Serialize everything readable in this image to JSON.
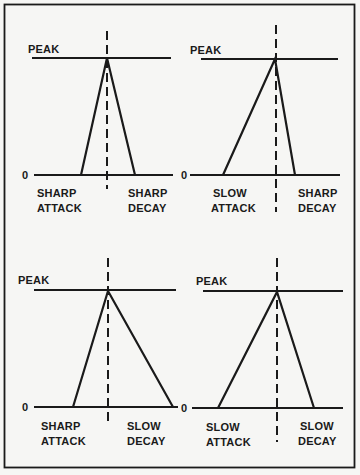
{
  "diagram": {
    "title": "",
    "panels": [
      {
        "id": "sharp-attack-sharp-decay",
        "peak_label": "PEAK",
        "zero_label": "0",
        "attack_label": [
          "SHARP",
          "ATTACK"
        ],
        "decay_label": [
          "SHARP",
          "DECAY"
        ]
      },
      {
        "id": "slow-attack-sharp-decay",
        "peak_label": "PEAK",
        "zero_label": "0",
        "attack_label": [
          "SLOW",
          "ATTACK"
        ],
        "decay_label": [
          "SHARP",
          "DECAY"
        ]
      },
      {
        "id": "sharp-attack-slow-decay",
        "peak_label": "PEAK",
        "zero_label": "0",
        "attack_label": [
          "SHARP",
          "ATTACK"
        ],
        "decay_label": [
          "SLOW",
          "DECAY"
        ]
      },
      {
        "id": "slow-attack-slow-decay",
        "peak_label": "PEAK",
        "zero_label": "0",
        "attack_label": [
          "SLOW",
          "ATTACK"
        ],
        "decay_label": [
          "SLOW",
          "DECAY"
        ]
      }
    ],
    "colors": {
      "background": "#f6f6f4",
      "ink": "#1a1a1a"
    }
  }
}
